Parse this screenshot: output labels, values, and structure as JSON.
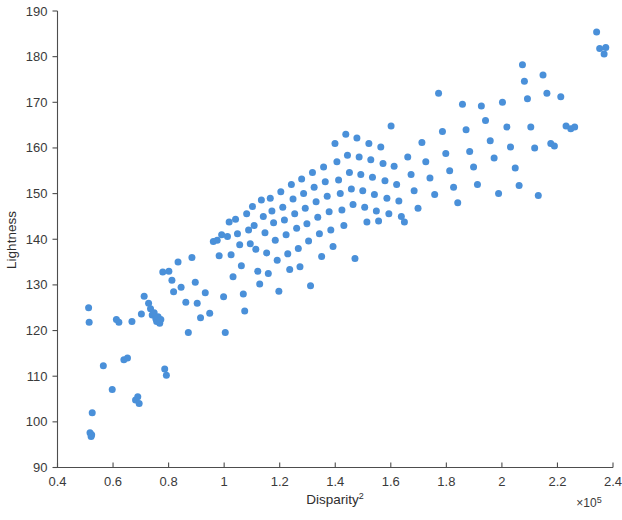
{
  "figure": {
    "background": "#ffffff",
    "marker_color": "#4a90d9",
    "axis_color": "#4d4d4d",
    "width": 622,
    "height": 520
  },
  "axes": {
    "x_label_base": "Disparity",
    "x_label_exponent": "2",
    "y_label": "Lightness",
    "multiplier_base": "×10",
    "multiplier_exponent": "5",
    "x_tick_labels": [
      "0.4",
      "0.6",
      "0.8",
      "1",
      "1.2",
      "1.4",
      "1.6",
      "1.8",
      "2",
      "2.2",
      "2.4"
    ],
    "y_tick_labels": [
      "90",
      "100",
      "110",
      "120",
      "130",
      "140",
      "150",
      "160",
      "170",
      "180",
      "190"
    ]
  },
  "chart_data": {
    "type": "scatter",
    "title": "",
    "xlabel": "Disparity^2",
    "ylabel": "Lightness",
    "x_multiplier": 100000,
    "xlim": [
      0.4,
      2.4
    ],
    "ylim": [
      90,
      190
    ],
    "xticks": [
      0.4,
      0.6,
      0.8,
      1.0,
      1.2,
      1.4,
      1.6,
      1.8,
      2.0,
      2.2,
      2.4
    ],
    "yticks": [
      90,
      100,
      110,
      120,
      130,
      140,
      150,
      160,
      170,
      180,
      190
    ],
    "grid": false,
    "legend": "none",
    "marker": "filled-circle",
    "marker_size": 7,
    "series": [
      {
        "name": "observations",
        "color": "#4a90d9",
        "points": [
          [
            0.512,
            125.0
          ],
          [
            0.514,
            121.8
          ],
          [
            0.517,
            97.6
          ],
          [
            0.521,
            96.8
          ],
          [
            0.523,
            97.2
          ],
          [
            0.525,
            102.0
          ],
          [
            0.565,
            112.3
          ],
          [
            0.597,
            107.1
          ],
          [
            0.612,
            122.4
          ],
          [
            0.621,
            121.8
          ],
          [
            0.639,
            113.6
          ],
          [
            0.652,
            114.0
          ],
          [
            0.668,
            122.0
          ],
          [
            0.681,
            104.8
          ],
          [
            0.689,
            105.5
          ],
          [
            0.694,
            104.0
          ],
          [
            0.702,
            123.6
          ],
          [
            0.712,
            127.5
          ],
          [
            0.728,
            126.0
          ],
          [
            0.735,
            124.8
          ],
          [
            0.741,
            123.4
          ],
          [
            0.748,
            123.9
          ],
          [
            0.754,
            122.6
          ],
          [
            0.757,
            122.0
          ],
          [
            0.762,
            123.0
          ],
          [
            0.768,
            121.6
          ],
          [
            0.772,
            122.4
          ],
          [
            0.779,
            132.8
          ],
          [
            0.786,
            111.6
          ],
          [
            0.792,
            110.2
          ],
          [
            0.801,
            133.0
          ],
          [
            0.812,
            131.0
          ],
          [
            0.818,
            128.5
          ],
          [
            0.834,
            135.0
          ],
          [
            0.845,
            129.5
          ],
          [
            0.862,
            126.2
          ],
          [
            0.871,
            119.6
          ],
          [
            0.884,
            136.0
          ],
          [
            0.896,
            130.6
          ],
          [
            0.903,
            126.0
          ],
          [
            0.915,
            122.8
          ],
          [
            0.932,
            128.3
          ],
          [
            0.948,
            123.8
          ],
          [
            0.961,
            139.5
          ],
          [
            0.975,
            139.8
          ],
          [
            0.982,
            136.4
          ],
          [
            0.991,
            141.0
          ],
          [
            0.998,
            127.4
          ],
          [
            1.004,
            119.6
          ],
          [
            1.012,
            140.6
          ],
          [
            1.018,
            143.8
          ],
          [
            1.025,
            136.6
          ],
          [
            1.032,
            131.8
          ],
          [
            1.041,
            144.4
          ],
          [
            1.048,
            141.2
          ],
          [
            1.056,
            138.8
          ],
          [
            1.062,
            134.2
          ],
          [
            1.069,
            128.0
          ],
          [
            1.074,
            124.3
          ],
          [
            1.081,
            145.6
          ],
          [
            1.088,
            142.0
          ],
          [
            1.094,
            139.0
          ],
          [
            1.102,
            147.2
          ],
          [
            1.108,
            143.0
          ],
          [
            1.114,
            137.8
          ],
          [
            1.121,
            133.0
          ],
          [
            1.128,
            130.2
          ],
          [
            1.134,
            148.6
          ],
          [
            1.141,
            145.0
          ],
          [
            1.147,
            141.4
          ],
          [
            1.153,
            137.0
          ],
          [
            1.159,
            132.5
          ],
          [
            1.166,
            149.0
          ],
          [
            1.172,
            146.2
          ],
          [
            1.178,
            143.6
          ],
          [
            1.184,
            139.8
          ],
          [
            1.191,
            135.4
          ],
          [
            1.197,
            128.6
          ],
          [
            1.204,
            150.4
          ],
          [
            1.211,
            147.0
          ],
          [
            1.217,
            144.2
          ],
          [
            1.223,
            141.0
          ],
          [
            1.229,
            136.8
          ],
          [
            1.236,
            133.4
          ],
          [
            1.242,
            152.0
          ],
          [
            1.248,
            148.8
          ],
          [
            1.254,
            145.6
          ],
          [
            1.261,
            142.4
          ],
          [
            1.267,
            138.0
          ],
          [
            1.273,
            134.0
          ],
          [
            1.279,
            153.2
          ],
          [
            1.286,
            150.0
          ],
          [
            1.292,
            146.8
          ],
          [
            1.298,
            143.4
          ],
          [
            1.304,
            139.6
          ],
          [
            1.311,
            129.8
          ],
          [
            1.318,
            154.6
          ],
          [
            1.324,
            151.4
          ],
          [
            1.331,
            148.2
          ],
          [
            1.337,
            144.8
          ],
          [
            1.343,
            141.2
          ],
          [
            1.351,
            136.2
          ],
          [
            1.358,
            155.8
          ],
          [
            1.364,
            152.6
          ],
          [
            1.371,
            149.4
          ],
          [
            1.378,
            146.0
          ],
          [
            1.384,
            142.0
          ],
          [
            1.392,
            138.4
          ],
          [
            1.399,
            161.0
          ],
          [
            1.406,
            157.0
          ],
          [
            1.412,
            153.0
          ],
          [
            1.418,
            150.0
          ],
          [
            1.424,
            146.4
          ],
          [
            1.431,
            143.0
          ],
          [
            1.438,
            163.0
          ],
          [
            1.444,
            158.4
          ],
          [
            1.451,
            154.6
          ],
          [
            1.458,
            151.0
          ],
          [
            1.464,
            147.6
          ],
          [
            1.471,
            135.8
          ],
          [
            1.478,
            162.2
          ],
          [
            1.486,
            158.0
          ],
          [
            1.492,
            154.2
          ],
          [
            1.499,
            150.6
          ],
          [
            1.506,
            147.0
          ],
          [
            1.514,
            143.8
          ],
          [
            1.521,
            161.0
          ],
          [
            1.528,
            157.4
          ],
          [
            1.534,
            153.6
          ],
          [
            1.541,
            149.8
          ],
          [
            1.548,
            146.2
          ],
          [
            1.556,
            144.0
          ],
          [
            1.564,
            160.2
          ],
          [
            1.572,
            156.6
          ],
          [
            1.579,
            152.8
          ],
          [
            1.586,
            149.0
          ],
          [
            1.593,
            145.6
          ],
          [
            1.601,
            164.8
          ],
          [
            1.612,
            156.0
          ],
          [
            1.621,
            152.0
          ],
          [
            1.629,
            148.4
          ],
          [
            1.638,
            145.0
          ],
          [
            1.649,
            143.8
          ],
          [
            1.661,
            158.0
          ],
          [
            1.673,
            154.2
          ],
          [
            1.684,
            150.6
          ],
          [
            1.698,
            146.8
          ],
          [
            1.712,
            161.2
          ],
          [
            1.726,
            157.0
          ],
          [
            1.741,
            153.4
          ],
          [
            1.758,
            149.8
          ],
          [
            1.772,
            172.0
          ],
          [
            1.786,
            163.6
          ],
          [
            1.798,
            158.8
          ],
          [
            1.812,
            155.0
          ],
          [
            1.826,
            151.4
          ],
          [
            1.841,
            148.0
          ],
          [
            1.858,
            169.6
          ],
          [
            1.871,
            164.0
          ],
          [
            1.884,
            159.2
          ],
          [
            1.898,
            155.8
          ],
          [
            1.912,
            152.0
          ],
          [
            1.926,
            169.2
          ],
          [
            1.941,
            166.0
          ],
          [
            1.958,
            161.6
          ],
          [
            1.972,
            157.8
          ],
          [
            1.988,
            150.0
          ],
          [
            2.002,
            170.0
          ],
          [
            2.018,
            164.6
          ],
          [
            2.031,
            160.2
          ],
          [
            2.048,
            155.6
          ],
          [
            2.062,
            151.8
          ],
          [
            2.074,
            178.2
          ],
          [
            2.081,
            174.6
          ],
          [
            2.092,
            170.8
          ],
          [
            2.104,
            164.6
          ],
          [
            2.118,
            160.0
          ],
          [
            2.131,
            149.6
          ],
          [
            2.148,
            176.0
          ],
          [
            2.162,
            172.0
          ],
          [
            2.176,
            161.0
          ],
          [
            2.189,
            160.4
          ],
          [
            2.212,
            171.2
          ],
          [
            2.231,
            164.8
          ],
          [
            2.248,
            164.2
          ],
          [
            2.262,
            164.6
          ],
          [
            2.341,
            185.4
          ],
          [
            2.352,
            181.8
          ],
          [
            2.368,
            180.6
          ],
          [
            2.374,
            182.0
          ]
        ]
      }
    ]
  }
}
